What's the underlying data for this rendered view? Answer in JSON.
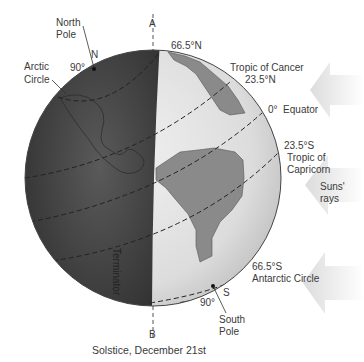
{
  "title": "Solstice, December 21st",
  "axis": {
    "top": "A",
    "bottom": "B"
  },
  "north_pole": {
    "label_line1": "North",
    "label_line2": "Pole",
    "letter": "N",
    "degrees": "90°"
  },
  "south_pole": {
    "label_line1": "South",
    "label_line2": "Pole",
    "letter": "S",
    "degrees": "90°"
  },
  "arctic_circle": {
    "line1": "Arctic",
    "line2": "Circle",
    "latitude": "66.5°N"
  },
  "tropic_cancer": {
    "name": "Tropic of Cancer",
    "latitude": "23.5°N"
  },
  "equator": {
    "label": "0°  Equator"
  },
  "tropic_capricorn": {
    "latitude": "23.5°S",
    "line1": "Tropic of",
    "line2": "Capricorn"
  },
  "antarctic_circle": {
    "latitude": "66.5°S",
    "name": "Antarctic Circle"
  },
  "terminator": "Terminator",
  "sun_rays": {
    "line1": "Suns'",
    "line2": "rays"
  },
  "colors": {
    "night": "#4a4a4a",
    "day": "#e2e2e2",
    "land_day": "#8a8a8a",
    "arrow": "#e6e6e6"
  }
}
